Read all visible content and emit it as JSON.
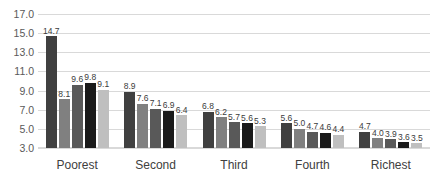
{
  "chart_data": {
    "type": "bar",
    "title": "",
    "subtitle": "",
    "xlabel": "",
    "ylabel": "",
    "categories": [
      "Poorest",
      "Second",
      "Third",
      "Fourth",
      "Richest"
    ],
    "series": [
      {
        "name": "Series 1",
        "color": "#404040",
        "values": [
          14.7,
          8.9,
          6.8,
          5.6,
          4.7
        ]
      },
      {
        "name": "Series 2",
        "color": "#808080",
        "values": [
          8.1,
          7.6,
          6.2,
          5.0,
          4.0
        ]
      },
      {
        "name": "Series 3",
        "color": "#595959",
        "values": [
          9.6,
          7.1,
          5.7,
          4.7,
          3.9
        ]
      },
      {
        "name": "Series 4",
        "color": "#1a1a1a",
        "values": [
          9.8,
          6.9,
          5.6,
          4.6,
          3.6
        ]
      },
      {
        "name": "Series 5",
        "color": "#bfbfbf",
        "values": [
          9.1,
          6.4,
          5.3,
          4.4,
          3.5
        ]
      }
    ],
    "data_labels": [
      [
        "14.7",
        "8.1",
        "9.6",
        "9.8",
        "9.1"
      ],
      [
        "8.9",
        "7.6",
        "7.1",
        "6.9",
        "6.4"
      ],
      [
        "6.8",
        "6.2",
        "5.7",
        "5.6",
        "5.3"
      ],
      [
        "5.6",
        "5.0",
        "4.7",
        "4.6",
        "4.4"
      ],
      [
        "4.7",
        "4.0",
        "3.9",
        "3.6",
        "3.5"
      ]
    ],
    "ylim": [
      3.0,
      17.0
    ],
    "ytick_step": 2.0,
    "ytick_labels": [
      "17.0",
      "15.0",
      "13.0",
      "11.0",
      "9.0",
      "7.0",
      "5.0",
      "3.0"
    ],
    "ytick_values": [
      17.0,
      15.0,
      13.0,
      11.0,
      9.0,
      7.0,
      5.0,
      3.0
    ],
    "grid": true,
    "gridline_color": "#d9d9d9",
    "legend": "none",
    "legend_position": "none",
    "background": "#ffffff"
  }
}
